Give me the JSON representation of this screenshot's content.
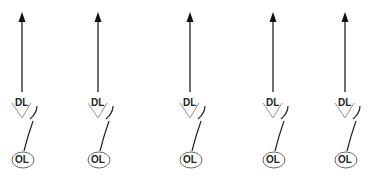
{
  "figure": {
    "background": "#ffffff",
    "stroke_color": "#222222",
    "light_stroke_color": "#888888",
    "units": [
      {
        "id": 1,
        "x": 22,
        "top_label": "DL",
        "bottom_label": "OL"
      },
      {
        "id": 2,
        "x": 98,
        "top_label": "DL",
        "bottom_label": "OL"
      },
      {
        "id": 3,
        "x": 190,
        "top_label": "DL",
        "bottom_label": "OL"
      },
      {
        "id": 4,
        "x": 273,
        "top_label": "DL",
        "bottom_label": "OL"
      },
      {
        "id": 5,
        "x": 345,
        "top_label": "DL",
        "bottom_label": "OL"
      }
    ]
  }
}
